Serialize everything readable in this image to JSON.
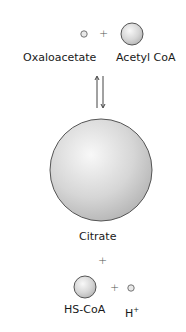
{
  "reaction": {
    "reactants_top": {
      "oxaloacetate": "Oxaloacetate",
      "acetyl_coa": "Acetyl CoA",
      "plus": "+"
    },
    "arrow": "equilibrium",
    "product": {
      "citrate": "Citrate"
    },
    "plus_between": "+",
    "products_bottom": {
      "hs_coa": "HS-CoA",
      "h_base": "H",
      "h_charge": "+",
      "plus": "+"
    }
  },
  "colors": {
    "sphere_fill_light": "#f7f7f7",
    "sphere_fill_dark": "#b8b8b8",
    "sphere_stroke": "#555555",
    "arrow": "#444444"
  }
}
